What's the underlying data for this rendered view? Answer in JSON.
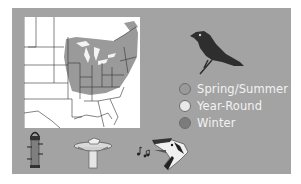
{
  "range_map": {
    "region": "Eastern United States",
    "shaded_color": "#9a9a9a"
  },
  "legend": {
    "items": [
      {
        "label": "Spring/Summer",
        "color": "#9a9a9a"
      },
      {
        "label": "Year-Round",
        "color": "#e8e8e8"
      },
      {
        "label": "Winter",
        "color": "#7c7c7c"
      }
    ]
  },
  "colors": {
    "panel": "#a3a3a3",
    "legend_text": "#f2f2f2"
  },
  "icons": {
    "bird": "bird-silhouette-icon",
    "feeder": "tube-feeder-icon",
    "bath": "birdbath-icon",
    "song": "music-notes-icon",
    "head": "bird-head-icon"
  }
}
